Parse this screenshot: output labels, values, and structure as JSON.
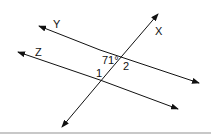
{
  "diagram": {
    "lines": [
      {
        "name": "Y",
        "label": "Y"
      },
      {
        "name": "Z",
        "label": "Z"
      },
      {
        "name": "X",
        "label": "X"
      }
    ],
    "angle_label": "71°",
    "angle_marks": [
      "1",
      "2"
    ]
  }
}
